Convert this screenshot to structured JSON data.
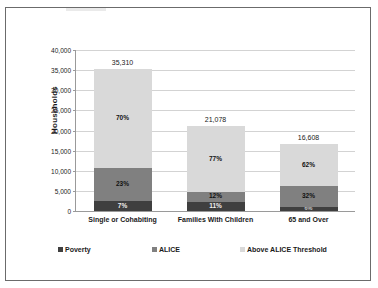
{
  "chart_data": {
    "type": "bar",
    "subtype": "stacked-bar",
    "title": "",
    "xlabel": "",
    "ylabel": "Households",
    "ylim": [
      0,
      40000
    ],
    "ytick_step": 5000,
    "yticks": [
      "0",
      "5,000",
      "10,000",
      "15,000",
      "20,000",
      "25,000",
      "30,000",
      "35,000",
      "40,000"
    ],
    "grid": true,
    "legend_position": "bottom",
    "categories": [
      "Single or Cohabiting",
      "Families With Children",
      "65 and Over"
    ],
    "totals": [
      35310,
      21078,
      16608
    ],
    "total_labels": [
      "35,310",
      "21,078",
      "16,608"
    ],
    "series": [
      {
        "name": "Poverty",
        "color": "#3f3f3f",
        "values": [
          2472,
          2319,
          997
        ],
        "percent_labels": [
          "7%",
          "11%",
          "6%"
        ]
      },
      {
        "name": "ALICE",
        "color": "#808080",
        "values": [
          8121,
          2529,
          5315
        ],
        "percent_labels": [
          "23%",
          "12%",
          "32%"
        ]
      },
      {
        "name": "Above ALICE Threshold",
        "color": "#d9d9d9",
        "values": [
          24717,
          16230,
          10297
        ],
        "percent_labels": [
          "70%",
          "77%",
          "62%"
        ]
      }
    ]
  },
  "legend": {
    "items": [
      {
        "label": "Poverty",
        "color": "#3f3f3f"
      },
      {
        "label": "ALICE",
        "color": "#808080"
      },
      {
        "label": "Above ALICE Threshold",
        "color": "#d9d9d9"
      }
    ]
  }
}
